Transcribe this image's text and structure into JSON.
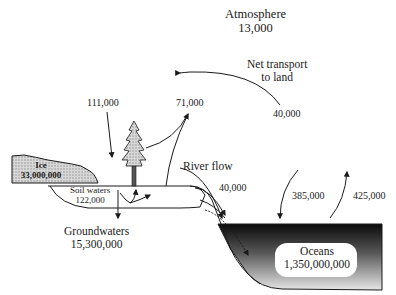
{
  "diagram": {
    "reservoirs": {
      "atmosphere": {
        "label": "Atmosphere",
        "value": "13,000"
      },
      "ice": {
        "label": "Ice",
        "value": "33,000,000"
      },
      "soil_waters": {
        "label": "Soil waters",
        "value": "122,000"
      },
      "groundwaters": {
        "label": "Groundwaters",
        "value": "15,300,000"
      },
      "oceans": {
        "label": "Oceans",
        "value": "1,350,000,000"
      }
    },
    "fluxes": {
      "precip_land": {
        "value": "111,000"
      },
      "evapotranspiration_land": {
        "value": "71,000"
      },
      "net_transport": {
        "label_line1": "Net transport",
        "label_line2": "to land",
        "value": "40,000"
      },
      "river_flow": {
        "label": "River flow",
        "value": "40,000"
      },
      "precip_ocean": {
        "value": "385,000"
      },
      "evap_ocean": {
        "value": "425,000"
      }
    },
    "colors": {
      "line": "#1a1a1a",
      "ice_fill": "#c8c8c8",
      "ocean_dark": "#111111",
      "ocean_light": "#e8e8e8",
      "background": "#ffffff"
    }
  }
}
